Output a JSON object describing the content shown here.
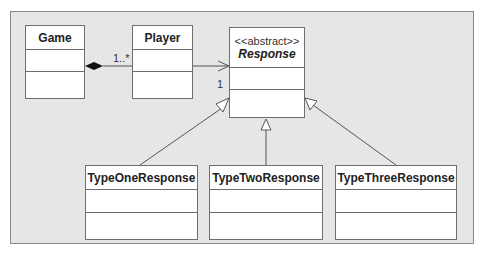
{
  "diagram": {
    "type": "UML class diagram",
    "classes": [
      {
        "id": "game",
        "name": "Game"
      },
      {
        "id": "player",
        "name": "Player"
      },
      {
        "id": "response",
        "stereotype": "<<abstract>>",
        "name": "Response",
        "abstract": true
      },
      {
        "id": "type_one",
        "name": "TypeOneResponse"
      },
      {
        "id": "type_two",
        "name": "TypeTwoResponse"
      },
      {
        "id": "type_three",
        "name": "TypeThreeResponse"
      }
    ],
    "relationships": [
      {
        "type": "composition",
        "from": "Game",
        "to": "Player",
        "multiplicity_to": "1..*"
      },
      {
        "type": "association",
        "from": "Player",
        "to": "Response",
        "multiplicity_to": "1",
        "navigable": true
      },
      {
        "type": "generalization",
        "from": "TypeOneResponse",
        "to": "Response"
      },
      {
        "type": "generalization",
        "from": "TypeTwoResponse",
        "to": "Response"
      },
      {
        "type": "generalization",
        "from": "TypeThreeResponse",
        "to": "Response"
      }
    ],
    "labels": {
      "player_multiplicity": "1..*",
      "response_multiplicity": "1"
    }
  }
}
